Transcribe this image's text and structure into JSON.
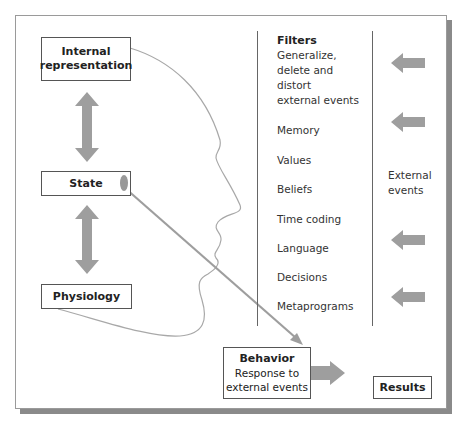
{
  "diagram": {
    "boxes": {
      "internal_representation": {
        "line1": "Internal",
        "line2": "representation"
      },
      "state": {
        "label": "State"
      },
      "physiology": {
        "label": "Physiology"
      },
      "behavior": {
        "title": "Behavior",
        "line1": "Response to",
        "line2": "external events"
      },
      "results": {
        "label": "Results"
      }
    },
    "filters": {
      "title": "Filters",
      "description": [
        "Generalize,",
        "delete and",
        "distort",
        "external events"
      ],
      "items": [
        "Memory",
        "Values",
        "Beliefs",
        "Time coding",
        "Language",
        "Decisions",
        "Metaprograms"
      ]
    },
    "external_events": {
      "line1": "External",
      "line2": "events"
    },
    "colors": {
      "arrow": "#9e9e9e",
      "outline": "#555555",
      "head_outline": "#a8a8a8",
      "shadow": "#8a8a8a"
    },
    "icons": {
      "double_arrows": [
        "double-arrow-icon",
        "double-arrow-icon"
      ],
      "incoming_arrows": [
        "left-arrow-icon",
        "left-arrow-icon",
        "left-arrow-icon",
        "left-arrow-icon"
      ],
      "behavior_arrow": "right-arrow-icon",
      "state_to_behavior": "diagonal-arrow-icon",
      "head_profile": "head-profile-icon"
    }
  }
}
